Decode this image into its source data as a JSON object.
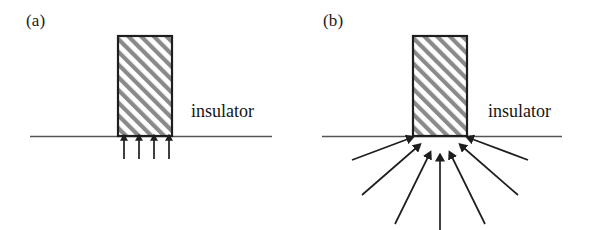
{
  "figure": {
    "type": "scientific-schematic",
    "width": 593,
    "height": 230,
    "background_color": "#ffffff"
  },
  "colors": {
    "line": "#2b2b2b",
    "baseline": "#555555",
    "hatch": "#8a8a8a",
    "fill": "#ffffff",
    "text": "#151515"
  },
  "panels": [
    {
      "id": "a",
      "label": "(a)",
      "label_pos": {
        "x": 26,
        "y": 11
      },
      "insulator_label": "insulator",
      "insulator_label_pos": {
        "x": 191,
        "y": 101
      },
      "baseline": {
        "x1": 30,
        "y": 136,
        "x2": 272
      },
      "electrode": {
        "x": 118,
        "y": 36,
        "width": 54,
        "height": 100
      },
      "arrow_style": "parallel-vertical",
      "arrow_count": 4,
      "arrows": [
        {
          "x1": 124,
          "y1": 158,
          "x2": 124,
          "y2": 137
        },
        {
          "x1": 139,
          "y1": 158,
          "x2": 139,
          "y2": 137
        },
        {
          "x1": 154,
          "y1": 158,
          "x2": 154,
          "y2": 137
        },
        {
          "x1": 169,
          "y1": 158,
          "x2": 169,
          "y2": 137
        }
      ]
    },
    {
      "id": "b",
      "label": "(b)",
      "label_pos": {
        "x": 27,
        "y": 11
      },
      "insulator_label": "insulator",
      "insulator_label_pos": {
        "x": 192,
        "y": 101
      },
      "baseline": {
        "x1": 26,
        "y": 136,
        "x2": 266
      },
      "electrode": {
        "x": 117,
        "y": 36,
        "width": 54,
        "height": 100
      },
      "arrow_style": "converging-fan",
      "arrow_count": 7,
      "arrows": [
        {
          "x1": 58,
          "y1": 159,
          "x2": 114,
          "y2": 139
        },
        {
          "x1": 68,
          "y1": 193,
          "x2": 121,
          "y2": 148
        },
        {
          "x1": 100,
          "y1": 222,
          "x2": 133,
          "y2": 157
        },
        {
          "x1": 144,
          "y1": 230,
          "x2": 144,
          "y2": 160
        },
        {
          "x1": 188,
          "y1": 222,
          "x2": 155,
          "y2": 157
        },
        {
          "x1": 220,
          "y1": 193,
          "x2": 167,
          "y2": 148
        },
        {
          "x1": 230,
          "y1": 159,
          "x2": 174,
          "y2": 139
        }
      ]
    }
  ],
  "hatch": {
    "angle_deg": 45,
    "direction": "bottom-left-to-top-right",
    "stripe_width": 4,
    "period": 9,
    "color": "#8a8a8a"
  }
}
